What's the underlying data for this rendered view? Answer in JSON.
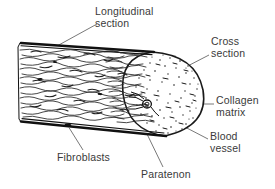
{
  "figure": {
    "background_color": "#ffffff",
    "ink_color": "#1a1a1a",
    "label_color": "#3a3a3a",
    "labels": [
      {
        "id": "longitudinal-section",
        "line1": "Longitudinal",
        "line2": "section"
      },
      {
        "id": "cross-section",
        "line1": "Cross",
        "line2": "section"
      },
      {
        "id": "collagen-matrix",
        "line1": "Collagen",
        "line2": "matrix"
      },
      {
        "id": "blood-vessel",
        "line1": "Blood",
        "line2": "vessel"
      },
      {
        "id": "fibroblasts",
        "line1": "Fibroblasts",
        "line2": ""
      },
      {
        "id": "paratenon",
        "line1": "Paratenon",
        "line2": ""
      }
    ],
    "parts": [
      {
        "id": "longitudinal-section",
        "description": "wavy collagen fibre bundles running lengthwise"
      },
      {
        "id": "cross-section",
        "description": "stippled elliptical cut face at the right end"
      },
      {
        "id": "collagen-matrix",
        "description": "dense stipple filling the cross-section"
      },
      {
        "id": "blood-vessel",
        "description": "small vessel opening inside the cross-section"
      },
      {
        "id": "fibroblasts",
        "description": "dark elongated cell nuclei between fibre bundles"
      },
      {
        "id": "paratenon",
        "description": "thin outer sheath bounding the tendon"
      }
    ]
  }
}
